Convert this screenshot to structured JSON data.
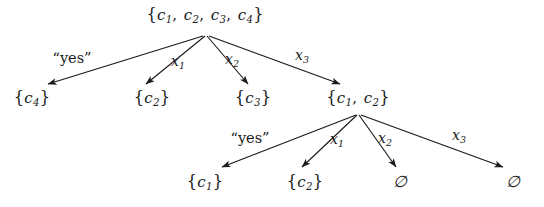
{
  "diagram": {
    "background_color": "#ffffff",
    "ink_color": "#1a1a1a",
    "type": "tree",
    "levels": 3
  },
  "nodes": [
    {
      "id": "root",
      "label": "{c1, c2, c3, c4}",
      "elements": [
        "{",
        "c",
        "1",
        ",",
        "c",
        "2",
        ",",
        "c",
        "3",
        ",",
        "c",
        "4",
        "}"
      ],
      "x": 205,
      "y": 16,
      "level": 0
    },
    {
      "id": "n-c4",
      "label": "{c4}",
      "x": 32,
      "y": 99,
      "level": 1
    },
    {
      "id": "n-c2-a",
      "label": "{c2}",
      "x": 152,
      "y": 99,
      "level": 1
    },
    {
      "id": "n-c3",
      "label": "{c3}",
      "x": 253,
      "y": 99,
      "level": 1
    },
    {
      "id": "n-c1c2",
      "label": "{c1, c2}",
      "x": 358,
      "y": 99,
      "level": 1
    },
    {
      "id": "n-c1",
      "label": "{c1}",
      "x": 205,
      "y": 183,
      "level": 2
    },
    {
      "id": "n-c2-b",
      "label": "{c2}",
      "x": 305,
      "y": 183,
      "level": 2
    },
    {
      "id": "n-empty-1",
      "label": "∅",
      "x": 400,
      "y": 182,
      "level": 2
    },
    {
      "id": "n-empty-2",
      "label": "∅",
      "x": 513,
      "y": 182,
      "level": 2
    }
  ],
  "edges": [
    {
      "id": "e-root-c4",
      "from": "root",
      "to": "n-c4",
      "label": "“yes”",
      "label_x": 72,
      "label_y": 58,
      "x1": 203,
      "y1": 36,
      "x2": 48,
      "y2": 84
    },
    {
      "id": "e-root-c2",
      "from": "root",
      "to": "n-c2-a",
      "label": "x1",
      "label_x": 178,
      "label_y": 62,
      "x1": 205,
      "y1": 36,
      "x2": 146,
      "y2": 84
    },
    {
      "id": "e-root-c3",
      "from": "root",
      "to": "n-c3",
      "label": "x2",
      "label_x": 232,
      "label_y": 60,
      "x1": 207,
      "y1": 36,
      "x2": 248,
      "y2": 84
    },
    {
      "id": "e-root-c1c2",
      "from": "root",
      "to": "n-c1c2",
      "label": "x3",
      "label_x": 302,
      "label_y": 56,
      "x1": 209,
      "y1": 36,
      "x2": 340,
      "y2": 84
    },
    {
      "id": "e-c1c2-c1",
      "from": "n-c1c2",
      "to": "n-c1",
      "label": "“yes”",
      "label_x": 250,
      "label_y": 138,
      "x1": 356,
      "y1": 115,
      "x2": 222,
      "y2": 167
    },
    {
      "id": "e-c1c2-c2",
      "from": "n-c1c2",
      "to": "n-c2-b",
      "label": "x1",
      "label_x": 337,
      "label_y": 140,
      "x1": 357,
      "y1": 115,
      "x2": 302,
      "y2": 167
    },
    {
      "id": "e-c1c2-empty1",
      "from": "n-c1c2",
      "to": "n-empty-1",
      "label": "x2",
      "label_x": 385,
      "label_y": 139,
      "x1": 359,
      "y1": 115,
      "x2": 396,
      "y2": 167
    },
    {
      "id": "e-c1c2-empty2",
      "from": "n-c1c2",
      "to": "n-empty-2",
      "label": "x3",
      "label_x": 459,
      "label_y": 136,
      "x1": 361,
      "y1": 115,
      "x2": 503,
      "y2": 167
    }
  ],
  "labels": {
    "yes": "“yes”",
    "x1": "x",
    "x1_sub": "1",
    "x2": "x",
    "x2_sub": "2",
    "x3": "x",
    "x3_sub": "3",
    "empty_set": "∅",
    "open_brace": "{",
    "close_brace": "}",
    "comma": ",",
    "c": "c",
    "sub1": "1",
    "sub2": "2",
    "sub3": "3",
    "sub4": "4"
  }
}
